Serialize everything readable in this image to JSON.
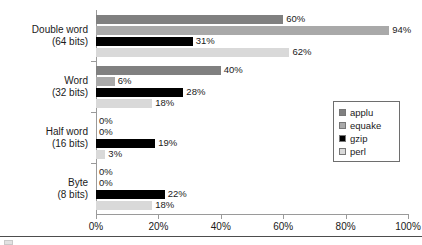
{
  "chart_data": {
    "type": "bar",
    "orientation": "horizontal",
    "title": "",
    "xlabel": "",
    "ylabel": "",
    "xlim": [
      0,
      100
    ],
    "grid": false,
    "legend_position": "right",
    "categories": [
      {
        "line1": "Double word",
        "line2": "(64 bits)"
      },
      {
        "line1": "Word",
        "line2": "(32 bits)"
      },
      {
        "line1": "Half word",
        "line2": "(16 bits)"
      },
      {
        "line1": "Byte",
        "line2": "(8 bits)"
      }
    ],
    "category_labels": [
      "Double word (64 bits)",
      "Word (32 bits)",
      "Half word (16 bits)",
      "Byte (8 bits)"
    ],
    "series": [
      {
        "name": "applu",
        "color": "#808080",
        "values": [
          60,
          40,
          0,
          0
        ],
        "labels": [
          "60%",
          "40%",
          "0%",
          "0%"
        ]
      },
      {
        "name": "equake",
        "color": "#a9a9a9",
        "values": [
          94,
          6,
          0,
          0
        ],
        "labels": [
          "94%",
          "6%",
          "0%",
          "0%"
        ]
      },
      {
        "name": "gzip",
        "color": "#000000",
        "values": [
          31,
          28,
          19,
          22
        ],
        "labels": [
          "31%",
          "28%",
          "19%",
          "22%"
        ]
      },
      {
        "name": "perl",
        "color": "#d9d9d9",
        "values": [
          62,
          18,
          3,
          18
        ],
        "labels": [
          "62%",
          "18%",
          "3%",
          "18%"
        ]
      }
    ],
    "xticks": [
      0,
      20,
      40,
      60,
      80,
      100
    ],
    "xtick_labels": [
      "0%",
      "20%",
      "40%",
      "60%",
      "80%",
      "100%"
    ]
  },
  "legend": {
    "entries": [
      {
        "label": "applu",
        "color": "#808080"
      },
      {
        "label": "equake",
        "color": "#a9a9a9"
      },
      {
        "label": "gzip",
        "color": "#000000"
      },
      {
        "label": "perl",
        "color": "#d9d9d9"
      }
    ]
  }
}
